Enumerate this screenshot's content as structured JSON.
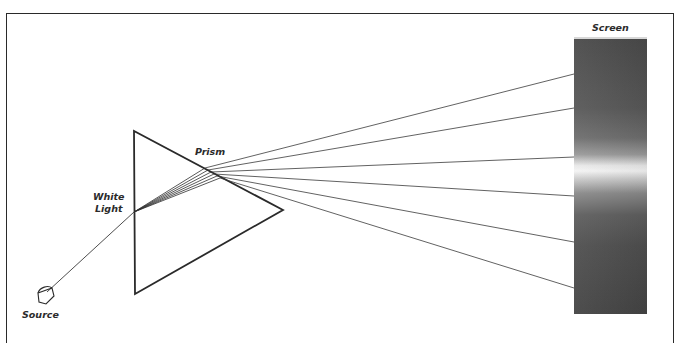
{
  "diagram": {
    "labels": {
      "screen": "Screen",
      "prism": "Prism",
      "white_light": "White\nLight",
      "source": "Source"
    },
    "colors": {
      "line": "#2a2a2a",
      "ray": "#3a3a3a",
      "screen_dark": "#4a4a4a",
      "screen_band": "#f4f4f4"
    },
    "geometry": {
      "prism_vertices": [
        [
          134,
          131
        ],
        [
          135,
          294
        ],
        [
          283,
          210
        ]
      ],
      "incident_ray": {
        "from": [
          47,
          292
        ],
        "to": [
          134,
          212
        ]
      },
      "ray_exit_points": [
        [
          205,
          168
        ],
        [
          208,
          170
        ],
        [
          211,
          172
        ],
        [
          214,
          174
        ],
        [
          217,
          176
        ],
        [
          220,
          178
        ]
      ],
      "ray_screen_hits": [
        [
          574,
          74
        ],
        [
          574,
          108
        ],
        [
          574,
          157
        ],
        [
          574,
          196
        ],
        [
          574,
          242
        ],
        [
          574,
          288
        ]
      ],
      "screen_rect": {
        "x": 574,
        "y": 37,
        "w": 73,
        "h": 277
      }
    }
  }
}
